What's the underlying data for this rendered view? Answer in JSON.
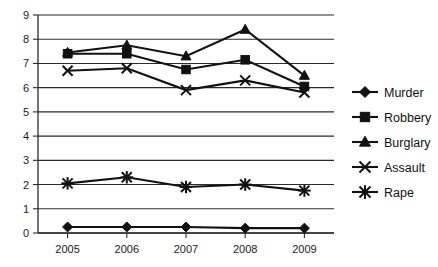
{
  "chart_data": {
    "type": "line",
    "title": "",
    "xlabel": "",
    "ylabel": "",
    "categories": [
      "2005",
      "2006",
      "2007",
      "2008",
      "2009"
    ],
    "ylim": [
      0,
      9
    ],
    "y_ticks": [
      "0",
      "1",
      "2",
      "3",
      "4",
      "5",
      "6",
      "7",
      "8",
      "9"
    ],
    "grid": "horizontal",
    "legend_position": "right",
    "series": [
      {
        "name": "Murder",
        "marker": "diamond",
        "values": [
          0.25,
          0.25,
          0.25,
          0.2,
          0.2
        ]
      },
      {
        "name": "Robbery",
        "marker": "square",
        "values": [
          7.4,
          7.4,
          6.75,
          7.15,
          6.05
        ]
      },
      {
        "name": "Burglary",
        "marker": "triangle",
        "values": [
          7.45,
          7.75,
          7.3,
          8.4,
          6.5
        ]
      },
      {
        "name": "Assault",
        "marker": "x",
        "values": [
          6.7,
          6.8,
          5.9,
          6.3,
          5.8
        ]
      },
      {
        "name": "Rape",
        "marker": "asterisk",
        "values": [
          2.05,
          2.3,
          1.9,
          2.0,
          1.75
        ]
      }
    ]
  },
  "colors": {
    "series": "#111111",
    "grid": "#2b2b2b",
    "axis": "#2b2b2b",
    "background": "#ffffff",
    "text": "#1a1a1a"
  },
  "legend": {
    "items": [
      {
        "label": "Murder"
      },
      {
        "label": "Robbery"
      },
      {
        "label": "Burglary"
      },
      {
        "label": "Assault"
      },
      {
        "label": "Rape"
      }
    ]
  }
}
